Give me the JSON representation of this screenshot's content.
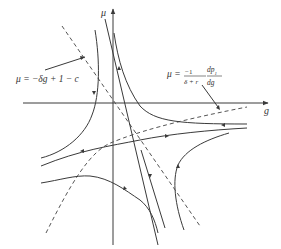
{
  "figure": {
    "type": "phase-diagram",
    "axes": {
      "x_label": "g",
      "y_label": "μ"
    },
    "annotations": {
      "isocline_linear": {
        "lhs": "μ = −δg + 1 − c"
      },
      "isocline_curve": {
        "lhs": "μ =",
        "frac1_num": "−1",
        "frac1_den": "δ + r",
        "frac2_num": "dp",
        "frac2_num_sub": "1",
        "frac2_den": "dg"
      }
    },
    "colors": {
      "line": "#3a3a3a",
      "dashed": "#555555",
      "background": "#ffffff"
    }
  }
}
